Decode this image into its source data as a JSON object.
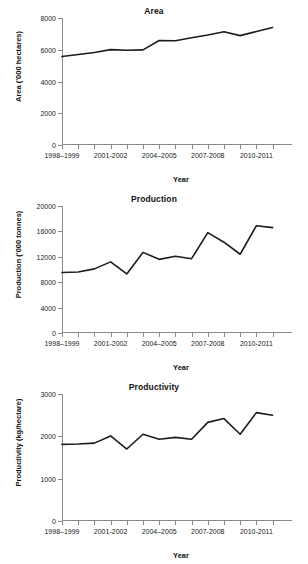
{
  "figure": {
    "panels": [
      "area",
      "production",
      "productivity"
    ]
  },
  "chart_data": [
    {
      "type": "line",
      "title": "Area",
      "xlabel": "Year",
      "ylabel": "Area ('000 hectares)",
      "ylim": [
        0,
        8000
      ],
      "yticks": [
        0,
        2000,
        4000,
        6000,
        8000
      ],
      "ytick_labels": [
        "0",
        "2000",
        "4000",
        "6000",
        "8000"
      ],
      "grid": false,
      "legend": "none",
      "x": [
        "1998–1999",
        "1999–2000",
        "2000–2001",
        "2001-2002",
        "2002–2003",
        "2003–2004",
        "2004–2005",
        "2005–2006",
        "2006–2007",
        "2007-2008",
        "2008–2009",
        "2009–2010",
        "2010-2011",
        "2011–2012"
      ],
      "xtick_labels": [
        "1998–1999",
        "2001-2002",
        "2004–2005",
        "2007-2008",
        "2010-2011"
      ],
      "xtick_index": [
        0,
        3,
        6,
        9,
        12
      ],
      "values": [
        5570,
        5700,
        5830,
        6010,
        5970,
        5990,
        6580,
        6570,
        6760,
        6930,
        7130,
        6890,
        7150,
        7400
      ]
    },
    {
      "type": "line",
      "title": "Production",
      "xlabel": "Year",
      "ylabel": "Production ('000 tonnes)",
      "ylim": [
        0,
        20000
      ],
      "yticks": [
        0,
        4000,
        8000,
        12000,
        16000,
        20000
      ],
      "ytick_labels": [
        "0",
        "4000",
        "8000",
        "12000",
        "16000",
        "20000"
      ],
      "grid": false,
      "legend": "none",
      "x": [
        "1998–1999",
        "1999–2000",
        "2000–2001",
        "2001-2002",
        "2002–2003",
        "2003–2004",
        "2004–2005",
        "2005–2006",
        "2006–2007",
        "2007-2008",
        "2008–2009",
        "2009–2010",
        "2010-2011",
        "2011–2012"
      ],
      "xtick_labels": [
        "1998–1999",
        "2001-2002",
        "2004–2005",
        "2007-2008",
        "2010-2011"
      ],
      "xtick_index": [
        0,
        3,
        6,
        9,
        12
      ],
      "values": [
        9520,
        9600,
        10100,
        11200,
        9300,
        12700,
        11600,
        12100,
        11700,
        15800,
        14300,
        12400,
        16900,
        16600
      ]
    },
    {
      "type": "line",
      "title": "Productivity",
      "xlabel": "Year",
      "ylabel": "Productivity (kg/hectare)",
      "ylim": [
        0,
        3000
      ],
      "yticks": [
        0,
        1000,
        2000,
        3000
      ],
      "ytick_labels": [
        "0",
        "1000",
        "2000",
        "3000"
      ],
      "grid": false,
      "legend": "none",
      "x": [
        "1998–1999",
        "1999–2000",
        "2000–2001",
        "2001-2002",
        "2002–2003",
        "2003–2004",
        "2004–2005",
        "2005–2006",
        "2006–2007",
        "2007-2008",
        "2008–2009",
        "2009–2010",
        "2010-2011",
        "2011–2012"
      ],
      "xtick_labels": [
        "1998–1999",
        "2001-2002",
        "2004–2005",
        "2007-2008",
        "2010-2011"
      ],
      "xtick_index": [
        0,
        3,
        6,
        9,
        12
      ],
      "values": [
        1810,
        1820,
        1840,
        2010,
        1700,
        2050,
        1930,
        1975,
        1930,
        2330,
        2420,
        2050,
        2560,
        2500
      ]
    }
  ]
}
